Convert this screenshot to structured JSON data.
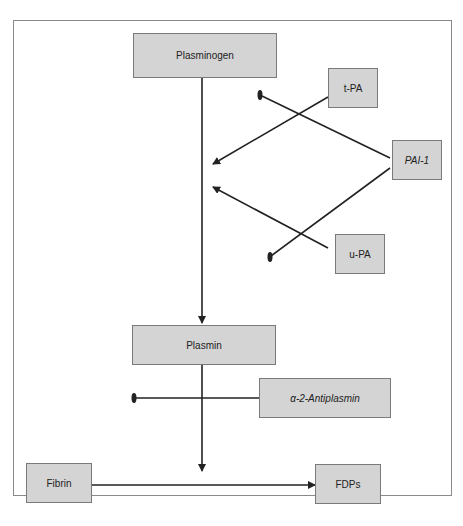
{
  "diagram": {
    "type": "pathway",
    "nodes": [
      {
        "id": "plasminogen",
        "label": "Plasminogen",
        "italic": false
      },
      {
        "id": "tpa",
        "label": "t-PA",
        "italic": false
      },
      {
        "id": "pai1",
        "label": "PAI-1",
        "italic": true
      },
      {
        "id": "upa",
        "label": "u-PA",
        "italic": false
      },
      {
        "id": "plasmin",
        "label": "Plasmin",
        "italic": false
      },
      {
        "id": "antiplasmin",
        "label": "α-2-Antiplasmin",
        "italic": true
      },
      {
        "id": "fibrin",
        "label": "Fibrin",
        "italic": false
      },
      {
        "id": "fdps",
        "label": "FDPs",
        "italic": false
      }
    ],
    "edges": [
      {
        "from": "plasminogen",
        "to": "plasmin",
        "type": "activation"
      },
      {
        "from": "tpa",
        "to": "plasminogen-plasmin",
        "type": "activation"
      },
      {
        "from": "upa",
        "to": "plasminogen-plasmin",
        "type": "activation"
      },
      {
        "from": "pai1",
        "to": "tpa",
        "type": "inhibition"
      },
      {
        "from": "pai1",
        "to": "upa",
        "type": "inhibition"
      },
      {
        "from": "antiplasmin",
        "to": "plasmin",
        "type": "inhibition"
      },
      {
        "from": "plasmin",
        "to": "fibrin-fdps",
        "type": "activation"
      },
      {
        "from": "fibrin",
        "to": "fdps",
        "type": "conversion"
      }
    ]
  }
}
